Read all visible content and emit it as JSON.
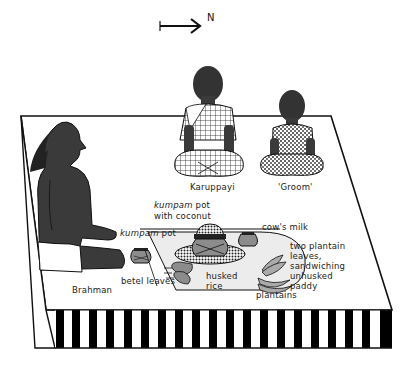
{
  "compass": {
    "direction_label": "N",
    "icon": "arrow-right-icon"
  },
  "figures": {
    "brahman": {
      "label": "Brahman"
    },
    "karuppayi": {
      "label": "Karuppayi"
    },
    "groom": {
      "label": "'Groom'"
    }
  },
  "objects": {
    "kumpam_pot_coconut": {
      "label_italic": "kumpam",
      "label_rest": " pot",
      "label_line2": "with coconut"
    },
    "kumpam_pot": {
      "label_italic": "kumpam",
      "label_rest": " pot"
    },
    "cows_milk": {
      "label": "cow's milk"
    },
    "plantain_leaves": {
      "lines": [
        "two plantain",
        "leaves,",
        "sandwiching",
        "unhusked",
        "paddy"
      ]
    },
    "betel_leaves": {
      "label": "betel leaves"
    },
    "husked_rice": {
      "lines": [
        "husked",
        "rice"
      ]
    },
    "plantains": {
      "label": "plantains"
    }
  },
  "colors": {
    "figure_dark": "#3a3a3a",
    "object_gray": "#8c8c8c",
    "leaf_light": "#e4e4e4",
    "stripe": "#000000"
  }
}
